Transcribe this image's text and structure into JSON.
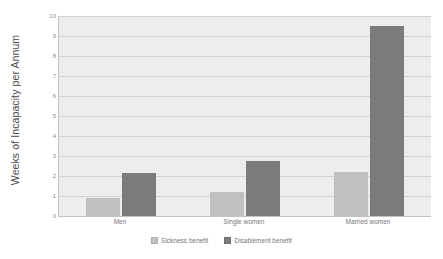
{
  "chart_data": {
    "type": "bar",
    "title": "",
    "xlabel": "",
    "ylabel": "Weeks of Incapacity per Annum",
    "categories": [
      "Men",
      "Single women",
      "Married women"
    ],
    "series": [
      {
        "name": "Sickness benefit",
        "color": "#c0c0c0",
        "values": [
          0.9,
          1.2,
          2.2
        ]
      },
      {
        "name": "Disablement benefit",
        "color": "#7b7b7b",
        "values": [
          2.15,
          2.75,
          9.5
        ]
      }
    ],
    "ylim": [
      0,
      10
    ],
    "ytick_step": 1,
    "ytick_labels": [
      "0",
      "1",
      "2",
      "3",
      "4",
      "5",
      "6",
      "7",
      "8",
      "9",
      "10"
    ],
    "grid": "horizontal",
    "legend_position": "bottom",
    "plot_background": "#ededed",
    "axis_color": "#c2c2c2",
    "gridline_color": "#d2d2d2",
    "label_color": "#777777"
  }
}
